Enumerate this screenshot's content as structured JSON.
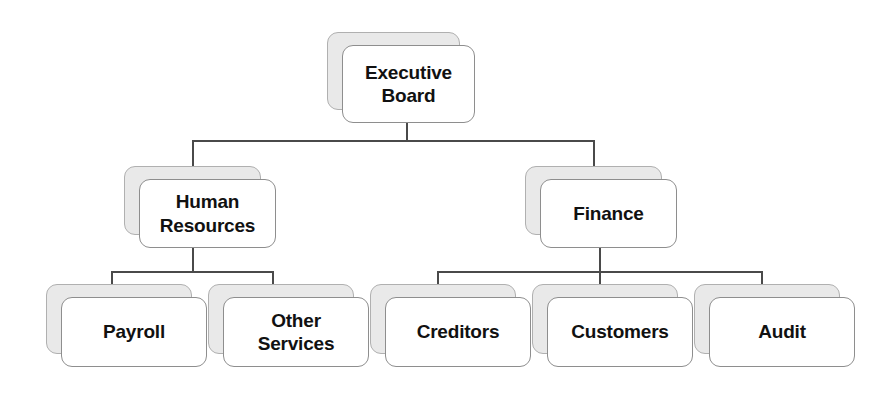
{
  "diagram": {
    "type": "organizational-chart",
    "orientation": "top-down",
    "levels": 3,
    "style": {
      "card_fill": "#ffffff",
      "card_border": "#8e8e8e",
      "shadow_fill": "#e9e9e9",
      "shadow_border": "#b0b0b0",
      "connector_color": "#4a4a4a",
      "text_color": "#111111",
      "background": "#ffffff"
    }
  },
  "nodes": {
    "executive_board": {
      "label": "Executive\nBoard",
      "level": 1,
      "parent": null
    },
    "human_resources": {
      "label": "Human\nResources",
      "level": 2,
      "parent": "executive_board"
    },
    "finance": {
      "label": "Finance",
      "level": 2,
      "parent": "executive_board"
    },
    "payroll": {
      "label": "Payroll",
      "level": 3,
      "parent": "human_resources"
    },
    "other_services": {
      "label": "Other\nServices",
      "level": 3,
      "parent": "human_resources"
    },
    "creditors": {
      "label": "Creditors",
      "level": 3,
      "parent": "finance"
    },
    "customers": {
      "label": "Customers",
      "level": 3,
      "parent": "finance"
    },
    "audit": {
      "label": "Audit",
      "level": 3,
      "parent": "finance"
    }
  },
  "edges": [
    {
      "from": "executive_board",
      "to": "human_resources"
    },
    {
      "from": "executive_board",
      "to": "finance"
    },
    {
      "from": "human_resources",
      "to": "payroll"
    },
    {
      "from": "human_resources",
      "to": "other_services"
    },
    {
      "from": "finance",
      "to": "creditors"
    },
    {
      "from": "finance",
      "to": "customers"
    },
    {
      "from": "finance",
      "to": "audit"
    }
  ]
}
